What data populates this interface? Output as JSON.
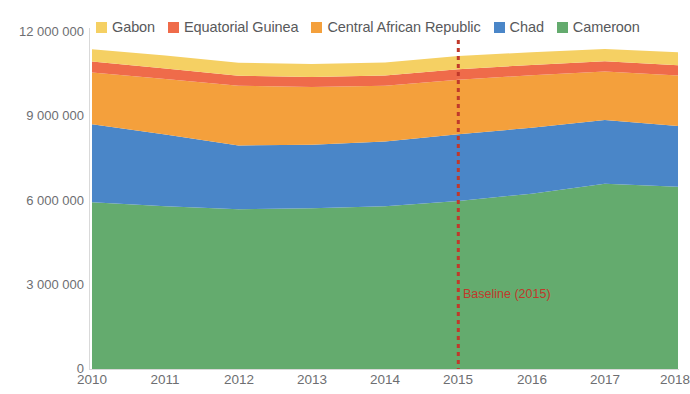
{
  "title": {
    "text": ""
  },
  "legend": {
    "position": "top",
    "items": [
      {
        "label": "Gabon",
        "color": "#f5d063"
      },
      {
        "label": "Equatorial Guinea",
        "color": "#ef6b4a"
      },
      {
        "label": "Central African Republic",
        "color": "#f4a03c"
      },
      {
        "label": "Chad",
        "color": "#4a86c8"
      },
      {
        "label": "Cameroon",
        "color": "#64ab6e"
      }
    ]
  },
  "axes": {
    "y_ticks": [
      "12 000 000",
      "9 000 000",
      "6 000 000",
      "3 000 000",
      "0"
    ],
    "y_tick_values": [
      12000000,
      9000000,
      6000000,
      3000000,
      0
    ],
    "x_ticks": [
      "2010",
      "2011",
      "2012",
      "2013",
      "2014",
      "2015",
      "2016",
      "2017",
      "2018"
    ],
    "ylabel": "",
    "xlabel": ""
  },
  "annotation": {
    "baseline_label": "Baseline (2015)",
    "baseline_year": 2015,
    "baseline_color": "#c0392b",
    "style": "dotted-vertical-line"
  },
  "chart_data": {
    "type": "area",
    "stacked": true,
    "title": "",
    "subtitle": "",
    "xlabel": "",
    "ylabel": "",
    "grid": false,
    "legend_position": "top",
    "ylim": [
      0,
      12000000
    ],
    "ytick_labels": [
      "0",
      "3 000 000",
      "6 000 000",
      "9 000 000",
      "12 000 000"
    ],
    "categories": [
      2010,
      2011,
      2012,
      2013,
      2014,
      2015,
      2016,
      2017,
      2018
    ],
    "x": [
      "2010",
      "2011",
      "2012",
      "2013",
      "2014",
      "2015",
      "2016",
      "2017",
      "2018"
    ],
    "stack_order_bottom_to_top": [
      "Cameroon",
      "Chad",
      "Central African Republic",
      "Equatorial Guinea",
      "Gabon"
    ],
    "series": [
      {
        "name": "Cameroon",
        "color": "#64ab6e",
        "values": [
          5870000,
          5730000,
          5620000,
          5660000,
          5730000,
          5910000,
          6170000,
          6520000,
          6410000
        ]
      },
      {
        "name": "Chad",
        "color": "#4a86c8",
        "values": [
          2740000,
          2520000,
          2250000,
          2230000,
          2280000,
          2350000,
          2320000,
          2240000,
          2140000
        ]
      },
      {
        "name": "Central African Republic",
        "color": "#f4a03c",
        "values": [
          1820000,
          1960000,
          2100000,
          2030000,
          1960000,
          1920000,
          1850000,
          1710000,
          1780000
        ]
      },
      {
        "name": "Equatorial Guinea",
        "color": "#ef6b4a",
        "values": [
          390000,
          360000,
          350000,
          360000,
          360000,
          370000,
          360000,
          360000,
          360000
        ]
      },
      {
        "name": "Gabon",
        "color": "#f5d063",
        "values": [
          430000,
          460000,
          460000,
          450000,
          460000,
          460000,
          450000,
          430000,
          460000
        ]
      }
    ],
    "totals": [
      11250000,
      11030000,
      10780000,
      10730000,
      10790000,
      11010000,
      11150000,
      11260000,
      11150000
    ],
    "annotations": [
      {
        "text": "Baseline (2015)",
        "x": "2015",
        "color": "#c0392b",
        "type": "vline"
      }
    ]
  }
}
